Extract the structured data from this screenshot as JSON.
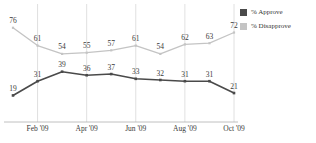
{
  "chart_data": {
    "type": "line",
    "title": "",
    "subtitle": "",
    "xlabel": "",
    "ylabel": "",
    "grid": true,
    "gridlines": "vertical at Feb '09, Apr '09, Jun '09, Aug '09, Oct '09",
    "legend_position": "right",
    "ylim": [
      0,
      100
    ],
    "x": [
      "Jan '09",
      "Feb '09",
      "Mar '09",
      "Apr '09",
      "May '09",
      "Jun '09",
      "Jul '09",
      "Aug '09",
      "Sep '09",
      "Oct '09"
    ],
    "tick_labels": [
      "Feb '09",
      "Apr '09",
      "Jun '09",
      "Aug '09",
      "Oct '09"
    ],
    "tick_indices": [
      1,
      3,
      5,
      7,
      9
    ],
    "series": [
      {
        "name": "% Approve",
        "color": "#4a4a4a",
        "values": [
          19,
          31,
          39,
          36,
          37,
          33,
          32,
          31,
          31,
          21
        ]
      },
      {
        "name": "% Disapprove",
        "color": "#c4c4c4",
        "values": [
          76,
          61,
          54,
          55,
          57,
          61,
          54,
          62,
          63,
          72
        ]
      }
    ]
  },
  "legend": {
    "items": [
      {
        "label": "% Approve",
        "color": "#4a4a4a"
      },
      {
        "label": "% Disapprove",
        "color": "#c4c4c4"
      }
    ]
  },
  "colors": {
    "approve": "#4a4a4a",
    "disapprove": "#c4c4c4",
    "axis": "#b0b0b0",
    "grid": "#d8d8d8",
    "text": "#3a3a3a",
    "background": "#ffffff"
  }
}
